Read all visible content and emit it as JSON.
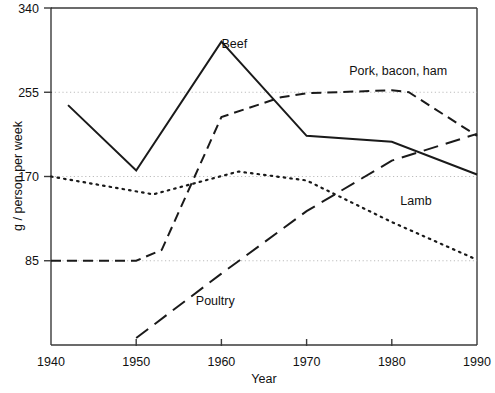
{
  "chart_data": {
    "type": "line",
    "title": "",
    "xlabel": "Year",
    "ylabel": "g / person per week",
    "xlim": [
      1940,
      1990
    ],
    "ylim": [
      0,
      340
    ],
    "grid": true,
    "legend_position": "inline-annotations",
    "xticks": [
      "1940",
      "1950",
      "1960",
      "1970",
      "1980",
      "1990"
    ],
    "xtick_values": [
      1940,
      1950,
      1960,
      1970,
      1980,
      1990
    ],
    "yticks": [
      "85",
      "170",
      "255",
      "340"
    ],
    "ytick_values": [
      85,
      170,
      255,
      340
    ],
    "gridlines_y": [
      85,
      170,
      255
    ],
    "series": [
      {
        "name": "Beef",
        "style": "solid",
        "label": "Beef",
        "x": [
          1942,
          1950,
          1960,
          1970,
          1980,
          1990
        ],
        "values": [
          242,
          176,
          306,
          211,
          205,
          172
        ]
      },
      {
        "name": "Pork, bacon, ham",
        "style": "dashed",
        "label": "Pork, bacon, ham",
        "x": [
          1940,
          1950,
          1953,
          1960,
          1967,
          1970,
          1980,
          1982,
          1990
        ],
        "values": [
          85,
          85,
          96,
          230,
          250,
          254,
          257,
          255,
          211
        ]
      },
      {
        "name": "Lamb",
        "style": "dotted",
        "label": "Lamb",
        "x": [
          1940,
          1952,
          1962,
          1970,
          1980,
          1990
        ],
        "values": [
          170,
          152,
          175,
          166,
          124,
          86
        ]
      },
      {
        "name": "Poultry",
        "style": "long-dashed",
        "label": "Poultry",
        "x": [
          1950,
          1960,
          1970,
          1980,
          1990
        ],
        "values": [
          7,
          72,
          135,
          186,
          213
        ]
      }
    ],
    "annotations": [
      {
        "text": "Beef",
        "x": 1960,
        "y": 300
      },
      {
        "text": "Pork, bacon, ham",
        "x": 1975,
        "y": 272
      },
      {
        "text": "Lamb",
        "x": 1981,
        "y": 141
      },
      {
        "text": "Poultry",
        "x": 1957,
        "y": 40
      }
    ]
  },
  "axis": {
    "y_title": "g / person per week",
    "x_title": "Year"
  }
}
